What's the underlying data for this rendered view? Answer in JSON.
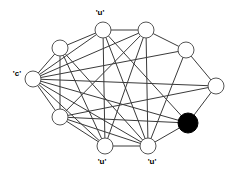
{
  "figure": {
    "type": "node-link-graph",
    "width": 236,
    "height": 171,
    "background_color": "#ffffff",
    "edge_color": "#3a3a3a",
    "node_stroke_color": "#555555",
    "node_open_fill": "#ffffff",
    "node_filled_fill": "#000000",
    "node_radius": 8,
    "filled_node_radius": 10
  },
  "graph_data": {
    "type": "graph",
    "node_count": 10,
    "labelled_node_count": 4,
    "nodes": [
      {
        "id": "n0",
        "name": "top-left-node",
        "x": 103,
        "y": 30,
        "style": "open",
        "label": "'u'",
        "label_x": 100,
        "label_y": 13,
        "label_position": "above"
      },
      {
        "id": "n1",
        "name": "top-right-node",
        "x": 146,
        "y": 30,
        "style": "open",
        "label": "",
        "label_x": 0,
        "label_y": 0,
        "label_position": "none"
      },
      {
        "id": "n2",
        "name": "upper-left-node",
        "x": 60,
        "y": 48,
        "style": "open",
        "label": "",
        "label_x": 0,
        "label_y": 0,
        "label_position": "none"
      },
      {
        "id": "n3",
        "name": "upper-right-node",
        "x": 186,
        "y": 50,
        "style": "open",
        "label": "",
        "label_x": 0,
        "label_y": 0,
        "label_position": "none"
      },
      {
        "id": "n4",
        "name": "left-node",
        "x": 33,
        "y": 79,
        "style": "open",
        "label": "'c'",
        "label_x": 17,
        "label_y": 74,
        "label_position": "left"
      },
      {
        "id": "n5",
        "name": "right-node",
        "x": 216,
        "y": 86,
        "style": "open",
        "label": "",
        "label_x": 0,
        "label_y": 0,
        "label_position": "none"
      },
      {
        "id": "n6",
        "name": "lower-left-node",
        "x": 60,
        "y": 117,
        "style": "open",
        "label": "",
        "label_x": 0,
        "label_y": 0,
        "label_position": "none"
      },
      {
        "id": "n7",
        "name": "selected-node",
        "x": 188,
        "y": 123,
        "style": "filled",
        "label": "",
        "label_x": 0,
        "label_y": 0,
        "label_position": "none"
      },
      {
        "id": "n8",
        "name": "bottom-left-node",
        "x": 105,
        "y": 146,
        "style": "open",
        "label": "'u'",
        "label_x": 102,
        "label_y": 162,
        "label_position": "below"
      },
      {
        "id": "n9",
        "name": "bottom-right-node",
        "x": 148,
        "y": 146,
        "style": "open",
        "label": "'u'",
        "label_x": 152,
        "label_y": 162,
        "label_position": "below"
      }
    ],
    "edges": [
      {
        "source": "n2",
        "target": "n0"
      },
      {
        "source": "n0",
        "target": "n1"
      },
      {
        "source": "n1",
        "target": "n3"
      },
      {
        "source": "n3",
        "target": "n5"
      },
      {
        "source": "n5",
        "target": "n7"
      },
      {
        "source": "n7",
        "target": "n9"
      },
      {
        "source": "n9",
        "target": "n8"
      },
      {
        "source": "n8",
        "target": "n6"
      },
      {
        "source": "n6",
        "target": "n4"
      },
      {
        "source": "n4",
        "target": "n2"
      },
      {
        "source": "n4",
        "target": "n0"
      },
      {
        "source": "n4",
        "target": "n1"
      },
      {
        "source": "n4",
        "target": "n3"
      },
      {
        "source": "n4",
        "target": "n5"
      },
      {
        "source": "n4",
        "target": "n7"
      },
      {
        "source": "n4",
        "target": "n9"
      },
      {
        "source": "n4",
        "target": "n8"
      },
      {
        "source": "n2",
        "target": "n6"
      },
      {
        "source": "n2",
        "target": "n8"
      },
      {
        "source": "n2",
        "target": "n9"
      },
      {
        "source": "n0",
        "target": "n8"
      },
      {
        "source": "n0",
        "target": "n9"
      },
      {
        "source": "n0",
        "target": "n7"
      },
      {
        "source": "n1",
        "target": "n9"
      },
      {
        "source": "n1",
        "target": "n8"
      },
      {
        "source": "n1",
        "target": "n6"
      },
      {
        "source": "n3",
        "target": "n9"
      },
      {
        "source": "n6",
        "target": "n5"
      },
      {
        "source": "n6",
        "target": "n7"
      },
      {
        "source": "n6",
        "target": "n9"
      }
    ],
    "labels": [
      "'u'",
      "'c'",
      "'u'",
      "'u'"
    ]
  }
}
